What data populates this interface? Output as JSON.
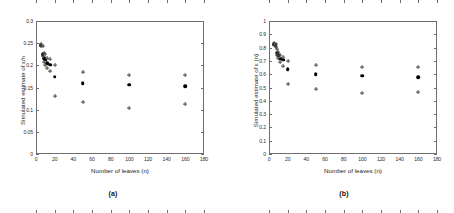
{
  "figure": {
    "panels": [
      {
        "id": "a",
        "caption": "(a)",
        "chart_data": {
          "type": "scatter",
          "title": "",
          "xlabel": "Number of leaves (n)",
          "ylabel": "Simulated estimate of ε/n",
          "xlim": [
            0,
            180
          ],
          "ylim": [
            0,
            0.3
          ],
          "xticks": [
            0,
            20,
            40,
            60,
            80,
            100,
            120,
            140,
            160,
            180
          ],
          "xticklabels": [
            "0",
            "20",
            "40",
            "60",
            "80",
            "100",
            "120",
            "140",
            "160",
            "180"
          ],
          "yticks": [
            0,
            0.05,
            0.1,
            0.15,
            0.2,
            0.25,
            0.3
          ],
          "yticklabels": [
            "0",
            "0.05",
            "0.1",
            "0.15",
            "0.2",
            "0.25",
            "0.3"
          ],
          "grid": false,
          "legend": "none",
          "series": [
            {
              "name": "mean estimate",
              "marker": "filled-circle",
              "x": [
                5,
                7,
                9,
                10,
                12,
                15,
                20,
                50,
                100,
                160
              ],
              "values": [
                0.2455,
                0.2255,
                0.2155,
                0.2125,
                0.2045,
                0.2015,
                0.1745,
                0.1595,
                0.1565,
                0.1535
              ]
            },
            {
              "name": "upper bound",
              "marker": "plus",
              "x": [
                5,
                7,
                9,
                10,
                12,
                15,
                20,
                50,
                100,
                160
              ],
              "values": [
                0.2485,
                0.2425,
                0.2285,
                0.2255,
                0.2175,
                0.2135,
                0.2005,
                0.1845,
                0.1785,
                0.1785
              ]
            },
            {
              "name": "lower bound",
              "marker": "plus",
              "x": [
                5,
                7,
                9,
                10,
                12,
                15,
                20,
                50,
                100,
                160
              ],
              "values": [
                0.2425,
                0.2205,
                0.2075,
                0.2005,
                0.1945,
                0.1875,
                0.1315,
                0.1175,
                0.1035,
                0.1135
              ]
            }
          ]
        }
      },
      {
        "id": "b",
        "caption": "(b)",
        "chart_data": {
          "type": "scatter",
          "title": "",
          "xlabel": "Number of leaves (n)",
          "ylabel": "Simulated estimate of ε (n)",
          "xlim": [
            0,
            180
          ],
          "ylim": [
            0,
            1
          ],
          "xticks": [
            0,
            20,
            40,
            60,
            80,
            100,
            120,
            140,
            160,
            180
          ],
          "xticklabels": [
            "0",
            "20",
            "40",
            "60",
            "80",
            "100",
            "120",
            "140",
            "160",
            "180"
          ],
          "yticks": [
            0,
            0.1,
            0.2,
            0.3,
            0.4,
            0.5,
            0.6,
            0.7,
            0.8,
            0.9,
            1
          ],
          "yticklabels": [
            "0",
            "0.1",
            "0.2",
            "0.3",
            "0.4",
            "0.5",
            "0.6",
            "0.7",
            "0.8",
            "0.9",
            "1"
          ],
          "grid": false,
          "legend": "none",
          "series": [
            {
              "name": "mean estimate",
              "marker": "filled-circle",
              "x": [
                5,
                7,
                9,
                10,
                12,
                15,
                20,
                50,
                100,
                160
              ],
              "values": [
                0.825,
                0.818,
                0.762,
                0.745,
                0.718,
                0.708,
                0.638,
                0.598,
                0.588,
                0.578
              ]
            },
            {
              "name": "upper bound",
              "marker": "plus",
              "x": [
                5,
                7,
                9,
                10,
                12,
                15,
                20,
                50,
                100,
                160
              ],
              "values": [
                0.832,
                0.828,
                0.788,
                0.768,
                0.742,
                0.732,
                0.702,
                0.668,
                0.655,
                0.652
              ]
            },
            {
              "name": "lower bound",
              "marker": "plus",
              "x": [
                5,
                7,
                9,
                10,
                12,
                15,
                20,
                50,
                100,
                160
              ],
              "values": [
                0.818,
                0.808,
                0.742,
                0.722,
                0.695,
                0.662,
                0.528,
                0.492,
                0.462,
                0.468
              ]
            }
          ]
        }
      }
    ]
  }
}
